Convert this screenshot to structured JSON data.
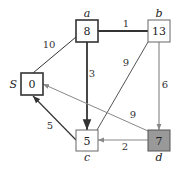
{
  "diagram": {
    "type": "weighted directed graph (shortest path)",
    "nodes": [
      {
        "id": "S",
        "label": "S",
        "value": "0",
        "x": 21,
        "y": 73,
        "w": 22,
        "h": 22,
        "fill": "#ffffff",
        "stroke": "#333333",
        "stroke_width": 1.6,
        "label_pos": "left"
      },
      {
        "id": "a",
        "label": "a",
        "value": "8",
        "x": 76,
        "y": 20,
        "w": 22,
        "h": 22,
        "fill": "#ffffff",
        "stroke": "#333333",
        "stroke_width": 1.6,
        "label_pos": "top"
      },
      {
        "id": "b",
        "label": "b",
        "value": "13",
        "x": 148,
        "y": 20,
        "w": 22,
        "h": 22,
        "fill": "#ffffff",
        "stroke": "#666666",
        "stroke_width": 1,
        "label_pos": "top"
      },
      {
        "id": "c",
        "label": "c",
        "value": "5",
        "x": 76,
        "y": 130,
        "w": 22,
        "h": 21,
        "fill": "#ffffff",
        "stroke": "#666666",
        "stroke_width": 1,
        "label_pos": "bottom"
      },
      {
        "id": "d",
        "label": "d",
        "value": "7",
        "x": 148,
        "y": 130,
        "w": 22,
        "h": 21,
        "fill": "#999999",
        "stroke": "#555555",
        "stroke_width": 1,
        "label_pos": "bottom"
      }
    ],
    "edges": [
      {
        "from": "S",
        "to": "a",
        "weight": "10",
        "x1": 33,
        "y1": 73,
        "x2": 76,
        "y2": 37,
        "color": "#333333",
        "width": 1,
        "arrow": false,
        "lx": 49,
        "ly": 48
      },
      {
        "from": "a",
        "to": "b",
        "weight": "1",
        "x1": 98,
        "y1": 31,
        "x2": 148,
        "y2": 31,
        "color": "#333333",
        "width": 1.8,
        "arrow": false,
        "lx": 126,
        "ly": 27
      },
      {
        "from": "a",
        "to": "c",
        "weight": "3",
        "x1": 87,
        "y1": 42,
        "x2": 87,
        "y2": 130,
        "color": "#333333",
        "width": 1.8,
        "arrow": true,
        "lx": 92,
        "ly": 77
      },
      {
        "from": "b",
        "to": "c",
        "weight": "9",
        "x1": 148,
        "y1": 42,
        "x2": 97,
        "y2": 130,
        "color": "#555555",
        "width": 1,
        "arrow": false,
        "lx": 126,
        "ly": 66
      },
      {
        "from": "b",
        "to": "d",
        "weight": "6",
        "x1": 159,
        "y1": 42,
        "x2": 159,
        "y2": 130,
        "color": "#777777",
        "width": 1,
        "arrow": true,
        "lx": 165,
        "ly": 88
      },
      {
        "from": "d",
        "to": "S",
        "weight": "9",
        "x1": 148,
        "y1": 131,
        "x2": 43,
        "y2": 84,
        "color": "#888888",
        "width": 1,
        "arrow": true,
        "lx": 133,
        "ly": 118
      },
      {
        "from": "c",
        "to": "S",
        "weight": "5",
        "x1": 76,
        "y1": 140,
        "x2": 33,
        "y2": 96,
        "color": "#333333",
        "width": 1.2,
        "arrow": true,
        "lx": 50,
        "ly": 129
      },
      {
        "from": "d",
        "to": "c",
        "weight": "2",
        "x1": 148,
        "y1": 140,
        "x2": 98,
        "y2": 140,
        "color": "#888888",
        "width": 1,
        "arrow": true,
        "lx": 125,
        "ly": 150
      }
    ]
  }
}
